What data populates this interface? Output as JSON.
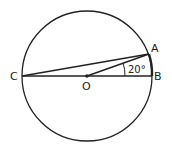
{
  "diagram": {
    "type": "circle-geometry",
    "circle": {
      "cx": 87,
      "cy": 76,
      "r": 65
    },
    "points": {
      "A": {
        "label": "A",
        "x": 149,
        "y": 55
      },
      "B": {
        "label": "B",
        "x": 152,
        "y": 76
      },
      "C": {
        "label": "C",
        "x": 22,
        "y": 76
      },
      "O": {
        "label": "O",
        "x": 87,
        "y": 76
      }
    },
    "segments": [
      "CB",
      "CA",
      "OA",
      "AB"
    ],
    "angle": {
      "vertex": "O",
      "between": [
        "A",
        "B"
      ],
      "label": "20°"
    },
    "colors": {
      "stroke": "#222222",
      "background": "#ffffff"
    }
  }
}
